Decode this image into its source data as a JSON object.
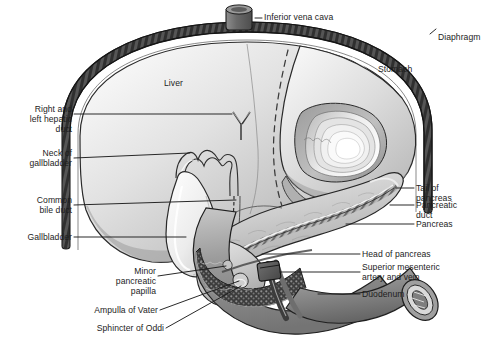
{
  "figure": {
    "style": "grayscale medical line illustration",
    "background_color": "#ffffff",
    "text_color": "#1d1d1d",
    "palette": {
      "diaphragm_band": "#4a4a4a",
      "liver_light": "#f2f2f2",
      "liver_mid": "#cfcfcf",
      "liver_dark": "#9d9d9d",
      "stomach_light": "#ededed",
      "stomach_mid": "#c4c4c4",
      "pancreas_light": "#e2e2e2",
      "pancreas_mid": "#b4b4b4",
      "duodenum_dark": "#7b7b7b",
      "gallbladder": "#efefef",
      "vessel_dark": "#3f3f3f",
      "outline": "#2b2b2b"
    }
  },
  "labels": {
    "inferior_vena_cava": "Inferior vena cava",
    "diaphragm": "Diaphragm",
    "stomach": "Stomach",
    "liver": "Liver",
    "right_and_left_hepatic_duct": "Right and\nleft hepatic\nduct",
    "neck_of_gallbladder": "Neck of\ngallbladder",
    "common_bile_duct": "Common\nbile duct",
    "gallbladder": "Gallbladder",
    "minor_pancreatic_papilla": "Minor\npancreatic\npapilla",
    "ampulla_of_vater": "Ampulla of Vater",
    "sphincter_of_oddi": "Sphincter of Oddi",
    "tail_of_pancreas": "Tail of\npancreas",
    "pancreatic_duct": "Pancreatic\nduct",
    "pancreas": "Pancreas",
    "head_of_pancreas": "Head of pancreas",
    "superior_mesenteric_artery_and_vein": "Superior mesenteric\nartery and vein",
    "duodenum": "Duodenum"
  }
}
